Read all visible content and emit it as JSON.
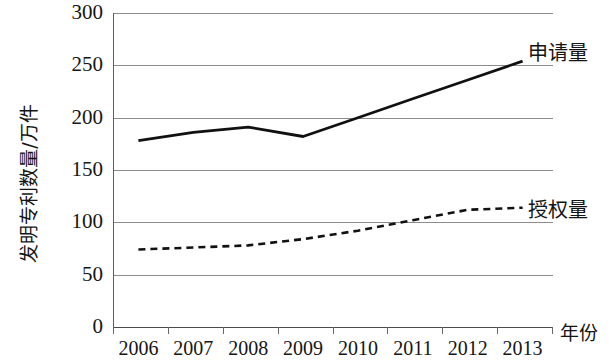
{
  "chart_data": {
    "type": "line",
    "title": "",
    "xlabel": "年份",
    "ylabel": "发明专利数量/万件",
    "categories": [
      "2006",
      "2007",
      "2008",
      "2009",
      "2010",
      "2011",
      "2012",
      "2013"
    ],
    "ylim": [
      0,
      300
    ],
    "yticks": [
      "0",
      "50",
      "100",
      "150",
      "200",
      "250",
      "300"
    ],
    "ytick_values": [
      0,
      50,
      100,
      150,
      200,
      250,
      300
    ],
    "grid": true,
    "legend_position": "right-inline-end-of-line",
    "series": [
      {
        "name": "申请量",
        "style": "solid",
        "color": "#111111",
        "values": [
          178,
          186,
          191,
          182,
          200,
          218,
          236,
          254
        ]
      },
      {
        "name": "授权量",
        "style": "dashed",
        "color": "#111111",
        "values": [
          74,
          76,
          78,
          84,
          92,
          102,
          112,
          114
        ]
      }
    ]
  },
  "axes": {
    "x_title": "年份",
    "y_title": "发明专利数量/万件"
  },
  "colors": {
    "line": "#111111",
    "grid": "#8c8c8c",
    "axis": "#4a4a4a",
    "text": "#151515",
    "background": "#ffffff"
  }
}
